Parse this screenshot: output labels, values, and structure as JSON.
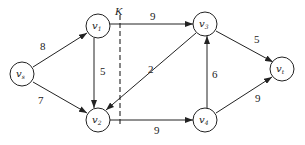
{
  "diagram": {
    "type": "flow-network",
    "nodes": [
      {
        "id": "vs",
        "base": "v",
        "sub": "s",
        "x": 22,
        "y": 74
      },
      {
        "id": "v1",
        "base": "v",
        "sub": "1",
        "x": 98,
        "y": 26
      },
      {
        "id": "v2",
        "base": "v",
        "sub": "2",
        "x": 98,
        "y": 120
      },
      {
        "id": "v3",
        "base": "v",
        "sub": "3",
        "x": 205,
        "y": 24
      },
      {
        "id": "v4",
        "base": "v",
        "sub": "4",
        "x": 205,
        "y": 120
      },
      {
        "id": "vt",
        "base": "v",
        "sub": "t",
        "x": 282,
        "y": 69
      }
    ],
    "edges": [
      {
        "from": "vs",
        "to": "v1",
        "weight": "8"
      },
      {
        "from": "vs",
        "to": "v2",
        "weight": "7"
      },
      {
        "from": "v1",
        "to": "v2",
        "weight": "5"
      },
      {
        "from": "v1",
        "to": "v3",
        "weight": "9"
      },
      {
        "from": "v3",
        "to": "v2",
        "weight": "2"
      },
      {
        "from": "v2",
        "to": "v4",
        "weight": "9"
      },
      {
        "from": "v4",
        "to": "v3",
        "weight": "6"
      },
      {
        "from": "v3",
        "to": "vt",
        "weight": "5"
      },
      {
        "from": "v4",
        "to": "vt",
        "weight": "9"
      }
    ],
    "cut": {
      "label": "K"
    }
  }
}
